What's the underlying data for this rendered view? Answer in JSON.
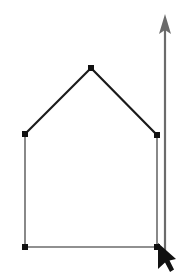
{
  "canvas": {
    "width": 195,
    "height": 276,
    "background_color": "#ffffff",
    "title": "House shape outline with vertical arrow and pointer"
  },
  "colors": {
    "stroke_dark": "#1a1a1a",
    "stroke_gray": "#6b6b6b",
    "vertex_fill": "#111111",
    "arrow_fill": "#6b6b6b",
    "cursor_fill": "#111111",
    "background": "#ffffff"
  },
  "shape": {
    "name": "house-polygon",
    "type": "polygon",
    "closed": true,
    "vertex_count": 5,
    "vertices": [
      {
        "label": "left-eave",
        "x": 25,
        "y": 134
      },
      {
        "label": "apex",
        "x": 91,
        "y": 68
      },
      {
        "label": "right-eave",
        "x": 157,
        "y": 135
      },
      {
        "label": "bottom-right",
        "x": 157,
        "y": 247
      },
      {
        "label": "bottom-left",
        "x": 25,
        "y": 247
      }
    ],
    "edges": [
      {
        "label": "left-roof-slope",
        "from": "left-eave",
        "to": "apex",
        "color": "#1a1a1a",
        "width": 2.2
      },
      {
        "label": "right-roof-slope",
        "from": "apex",
        "to": "right-eave",
        "color": "#1a1a1a",
        "width": 2.2
      },
      {
        "label": "right-wall",
        "from": "right-eave",
        "to": "bottom-right",
        "color": "#6b6b6b",
        "width": 1.6
      },
      {
        "label": "bottom-wall",
        "from": "bottom-right",
        "to": "bottom-left",
        "color": "#6b6b6b",
        "width": 1.6
      },
      {
        "label": "left-wall",
        "from": "bottom-left",
        "to": "left-eave",
        "color": "#6b6b6b",
        "width": 1.6
      }
    ],
    "handle_size": 6
  },
  "arrow": {
    "name": "vertical-up-arrow",
    "direction": "up",
    "color": "#6b6b6b",
    "shaft": {
      "x": 165,
      "y_top": 28,
      "y_bottom": 252,
      "width": 2.2
    },
    "head": {
      "tip_x": 165,
      "tip_y": 14,
      "half_width": 6,
      "base_y": 34
    }
  },
  "cursor": {
    "name": "mouse-pointer",
    "color": "#111111",
    "tip_x": 158,
    "tip_y": 243,
    "width": 18,
    "height": 26
  }
}
